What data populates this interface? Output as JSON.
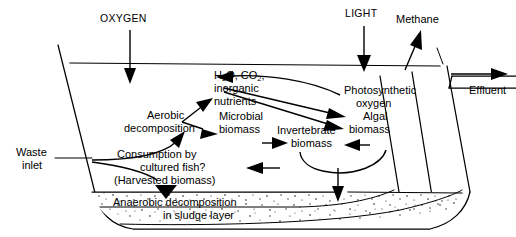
{
  "diagram": {
    "inputs": {
      "oxygen_label": "OXYGEN",
      "light_label": "LIGHT",
      "waste_inlet_label_line1": "Waste",
      "waste_inlet_label_line2": "inlet"
    },
    "outputs": {
      "methane_label": "Methane",
      "effluent_label": "Effluent"
    },
    "processes": {
      "water_chemistry_line1": "H",
      "water_chemistry_sub1": "2",
      "water_chemistry_line1b": "O, CO",
      "water_chemistry_sub2": "2",
      "water_chemistry_line1c": ",",
      "water_chemistry_line2": "inorganic",
      "water_chemistry_line3": "nutrients",
      "aerobic_line1": "Aerobic",
      "aerobic_line2": "decomposition",
      "microbial_line1": "Microbial",
      "microbial_line2": "biomass",
      "photosynthetic_line1": "Photosynthetic",
      "photosynthetic_line2": "oxygen",
      "algal_line1": "Algal",
      "algal_line2": "biomass",
      "invertebrate_line1": "Invertebrate",
      "invertebrate_line2": "biomass",
      "consumption_line1": "Consumption by",
      "consumption_line2": "cultured fish?",
      "consumption_line3": "(Harvested biomass)",
      "anaerobic_line1": "Anaerobic decomposition",
      "anaerobic_line2": "in sludge layer"
    },
    "colors": {
      "ink": "#000000",
      "background": "#ffffff",
      "sludge_dot": "#1a1a1a"
    }
  }
}
